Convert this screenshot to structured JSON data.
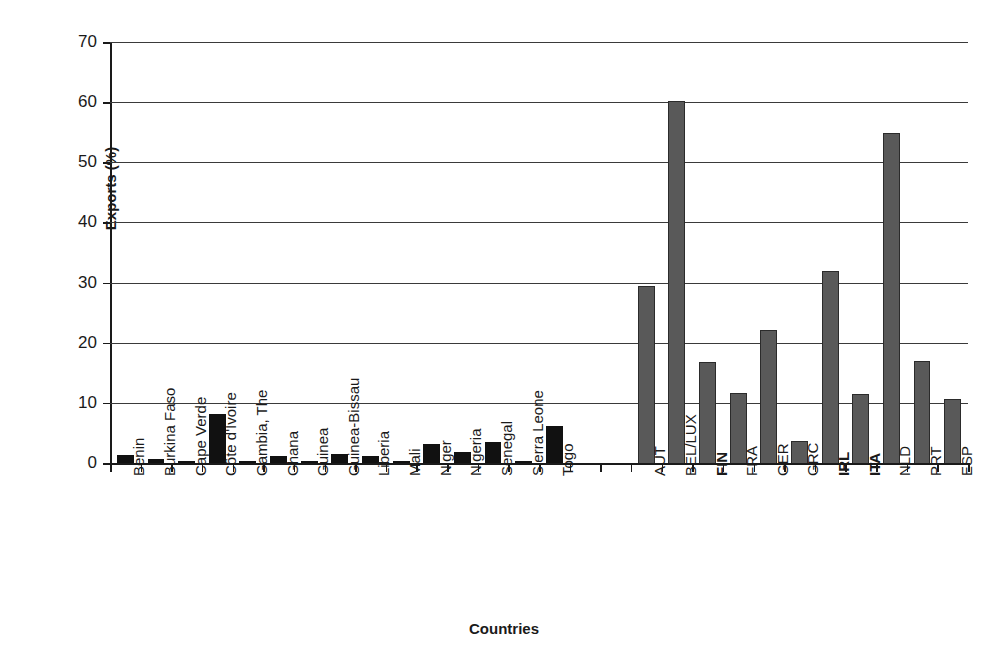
{
  "chart_data": {
    "type": "bar",
    "title": "",
    "xlabel": "Countries",
    "ylabel": "Exports (%)",
    "ylim": [
      0,
      70
    ],
    "ytick_values": [
      0,
      10,
      20,
      30,
      40,
      50,
      60,
      70
    ],
    "ytick_labels": [
      "0",
      "10",
      "20",
      "30",
      "40",
      "50",
      "60",
      "70"
    ],
    "grid": true,
    "legend": "none",
    "groups": [
      {
        "name": "West African countries",
        "bar_color": "#111111",
        "categories": [
          "Benin",
          "Burkina Faso",
          "Cape Verde",
          "Côte d'Ivoire",
          "Gambia, The",
          "Ghana",
          "Guinea",
          "Guinea-Bissau",
          "Liberia",
          "Mali",
          "Niger",
          "Nigeria",
          "Senegal",
          "Sierra Leone",
          "Togo"
        ],
        "values": [
          1.3,
          0.7,
          0.3,
          8.2,
          0.3,
          1.1,
          0.35,
          1.5,
          1.1,
          0.3,
          3.2,
          1.9,
          3.5,
          0.25,
          6.2
        ],
        "bold_labels": []
      },
      {
        "name": "European countries",
        "bar_color": "#595959",
        "categories": [
          "AUT",
          "BEL/LUX",
          "FIN",
          "FRA",
          "GER",
          "GRC",
          "IRL",
          "ITA",
          "NLD",
          "PRT",
          "ESP"
        ],
        "values": [
          29.5,
          60.2,
          16.8,
          11.7,
          22.1,
          3.7,
          32.0,
          11.5,
          54.8,
          16.9,
          10.7
        ],
        "bold_labels": [
          "FIN",
          "IRL",
          "ITA"
        ]
      }
    ],
    "gap_slots": 2,
    "colors": {
      "group1_bar": "#111111",
      "group2_bar": "#595959",
      "axis": "#1a1a1a",
      "gridline": "#3a3a3a",
      "background": "#ffffff"
    }
  }
}
